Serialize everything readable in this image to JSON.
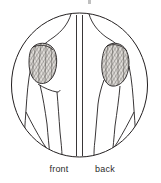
{
  "figure": {
    "kind": "anatomical-line-drawing",
    "frame_shape": "circle",
    "divider": "vertical-split",
    "background_color": "#ffffff",
    "line_color": "#231f20",
    "muscle_shading": "cross-hatch",
    "muscle_fill_color": "#d9d6d2",
    "label_color": "#2b2b2b"
  },
  "views": [
    {
      "id": "front",
      "label": "front",
      "side": "left",
      "muscle_label": "deltoid"
    },
    {
      "id": "back",
      "label": "back",
      "side": "right",
      "muscle_label": "deltoid"
    }
  ],
  "artifacts": {
    "top_mark": ""
  }
}
